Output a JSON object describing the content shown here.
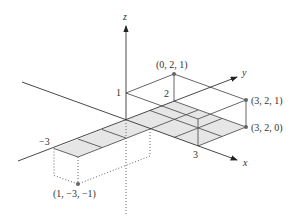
{
  "diagram": {
    "type": "3d-coordinate-sketch",
    "axes": {
      "x": {
        "label": "x"
      },
      "y": {
        "label": "y"
      },
      "z": {
        "label": "z"
      }
    },
    "tick_labels": {
      "z_one": "1",
      "y_two": "2",
      "x_three": "3",
      "y_neg_three": "−3"
    },
    "points": [
      {
        "label": "(0, 2, 1)",
        "coords": [
          0,
          2,
          1
        ]
      },
      {
        "label": "(3, 2, 1)",
        "coords": [
          3,
          2,
          1
        ]
      },
      {
        "label": "(3, 2, 0)",
        "coords": [
          3,
          2,
          0
        ]
      },
      {
        "label": "(1, −3, −1)",
        "coords": [
          1,
          -3,
          -1
        ]
      }
    ],
    "shaded_region": "grid on z=0 plane: x in [0,3], y in [0,2] plus x in [0,1], y in [-3,0]",
    "colors": {
      "line": "#555555",
      "shade": "#e6e6e6",
      "point": "#666666"
    }
  }
}
